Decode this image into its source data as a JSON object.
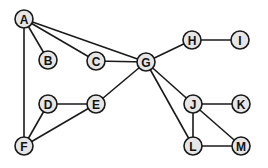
{
  "diagram": {
    "type": "undirected-graph",
    "colors": {
      "node_fill": "#e6e6e6",
      "node_stroke": "#1a1a1a",
      "edge": "#1a1a1a",
      "label": "#111111"
    },
    "nodes": [
      {
        "id": "A",
        "label": "A",
        "x": 24,
        "y": 19
      },
      {
        "id": "B",
        "label": "B",
        "x": 48,
        "y": 60
      },
      {
        "id": "C",
        "label": "C",
        "x": 96,
        "y": 61
      },
      {
        "id": "G",
        "label": "G",
        "x": 146,
        "y": 62
      },
      {
        "id": "H",
        "label": "H",
        "x": 192,
        "y": 40
      },
      {
        "id": "I",
        "label": "I",
        "x": 240,
        "y": 40
      },
      {
        "id": "D",
        "label": "D",
        "x": 48,
        "y": 104
      },
      {
        "id": "E",
        "label": "E",
        "x": 96,
        "y": 104
      },
      {
        "id": "F",
        "label": "F",
        "x": 24,
        "y": 146
      },
      {
        "id": "J",
        "label": "J",
        "x": 193,
        "y": 104
      },
      {
        "id": "K",
        "label": "K",
        "x": 241,
        "y": 104
      },
      {
        "id": "L",
        "label": "L",
        "x": 193,
        "y": 146
      },
      {
        "id": "M",
        "label": "M",
        "x": 241,
        "y": 146
      }
    ],
    "edges": [
      [
        "A",
        "B"
      ],
      [
        "A",
        "C"
      ],
      [
        "A",
        "G"
      ],
      [
        "A",
        "F"
      ],
      [
        "C",
        "G"
      ],
      [
        "G",
        "H"
      ],
      [
        "H",
        "I"
      ],
      [
        "G",
        "E"
      ],
      [
        "E",
        "D"
      ],
      [
        "E",
        "F"
      ],
      [
        "D",
        "F"
      ],
      [
        "G",
        "J"
      ],
      [
        "G",
        "L"
      ],
      [
        "J",
        "K"
      ],
      [
        "J",
        "L"
      ],
      [
        "J",
        "M"
      ],
      [
        "L",
        "M"
      ]
    ]
  }
}
